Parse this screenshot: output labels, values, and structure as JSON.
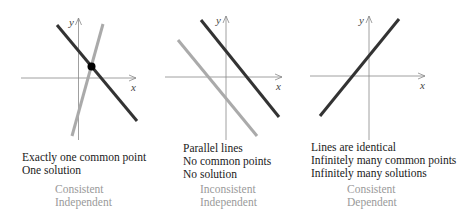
{
  "colors": {
    "primary_line": "#333333",
    "secondary_line": "#aaaaaa",
    "axis": "#888888",
    "caption_text": "#1a1a1a",
    "classification_text": "#9a9a9a",
    "intersection_point": "#000000"
  },
  "panels": [
    {
      "id": "one-solution",
      "axis_labels": {
        "x": "x",
        "y": "y"
      },
      "caption": [
        "Exactly one common point",
        "One solution"
      ],
      "classification": [
        "Consistent",
        "Independent"
      ]
    },
    {
      "id": "no-solution",
      "axis_labels": {
        "x": "x",
        "y": "y"
      },
      "caption": [
        "Parallel lines",
        "No common points",
        "No solution"
      ],
      "classification": [
        "Inconsistent",
        "Independent"
      ]
    },
    {
      "id": "infinite-solutions",
      "axis_labels": {
        "x": "x",
        "y": "y"
      },
      "caption": [
        "Lines are identical",
        "Infinitely many common points",
        "Infinitely many solutions"
      ],
      "classification": [
        "Consistent",
        "Dependent"
      ]
    }
  ]
}
